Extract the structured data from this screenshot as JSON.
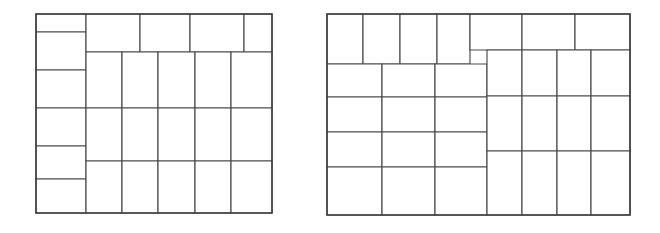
{
  "figure": {
    "title": "",
    "background_color": "#ffffff",
    "stroke_color": "#4a4a4a",
    "fill_color": "#ffffff",
    "width": 660,
    "height": 233,
    "caption": ""
  },
  "chart_data": {
    "type": "diagram",
    "subtype": "rectangle-packing-layout",
    "title": "",
    "xlabel": "",
    "ylabel": "",
    "grid": false,
    "legend": null,
    "panels": [
      {
        "name": "left-packing",
        "label": "",
        "container": {
          "x": 36,
          "y": 14,
          "width": 236,
          "height": 199
        },
        "rect_count": 27,
        "rects": [
          {
            "id": "L1",
            "x": 36,
            "y": 14,
            "width": 50,
            "height": 18
          },
          {
            "id": "L2",
            "x": 36,
            "y": 32,
            "width": 50,
            "height": 38
          },
          {
            "id": "L3",
            "x": 36,
            "y": 70,
            "width": 50,
            "height": 38
          },
          {
            "id": "L4",
            "x": 36,
            "y": 108,
            "width": 50,
            "height": 38
          },
          {
            "id": "L5",
            "x": 36,
            "y": 146,
            "width": 50,
            "height": 33
          },
          {
            "id": "L6",
            "x": 36,
            "y": 179,
            "width": 50,
            "height": 34
          },
          {
            "id": "L7",
            "x": 86,
            "y": 14,
            "width": 54,
            "height": 38
          },
          {
            "id": "L8",
            "x": 140,
            "y": 14,
            "width": 50,
            "height": 38
          },
          {
            "id": "L9",
            "x": 190,
            "y": 14,
            "width": 54,
            "height": 38
          },
          {
            "id": "L10",
            "x": 244,
            "y": 14,
            "width": 28,
            "height": 38
          },
          {
            "id": "L11",
            "x": 86,
            "y": 52,
            "width": 36,
            "height": 56
          },
          {
            "id": "L12",
            "x": 122,
            "y": 52,
            "width": 36,
            "height": 56
          },
          {
            "id": "L13",
            "x": 158,
            "y": 52,
            "width": 37,
            "height": 56
          },
          {
            "id": "L14",
            "x": 195,
            "y": 52,
            "width": 36,
            "height": 56
          },
          {
            "id": "L15",
            "x": 231,
            "y": 52,
            "width": 41,
            "height": 56
          },
          {
            "id": "L16",
            "x": 86,
            "y": 108,
            "width": 36,
            "height": 53
          },
          {
            "id": "L17",
            "x": 122,
            "y": 108,
            "width": 36,
            "height": 53
          },
          {
            "id": "L18",
            "x": 158,
            "y": 108,
            "width": 37,
            "height": 53
          },
          {
            "id": "L19",
            "x": 195,
            "y": 108,
            "width": 36,
            "height": 53
          },
          {
            "id": "L20",
            "x": 231,
            "y": 108,
            "width": 41,
            "height": 53
          },
          {
            "id": "L21",
            "x": 86,
            "y": 161,
            "width": 36,
            "height": 52
          },
          {
            "id": "L22",
            "x": 122,
            "y": 161,
            "width": 36,
            "height": 52
          },
          {
            "id": "L23",
            "x": 158,
            "y": 161,
            "width": 37,
            "height": 52
          },
          {
            "id": "L24",
            "x": 195,
            "y": 161,
            "width": 36,
            "height": 52
          },
          {
            "id": "L25",
            "x": 231,
            "y": 161,
            "width": 41,
            "height": 52
          }
        ]
      },
      {
        "name": "right-packing",
        "label": "",
        "container": {
          "x": 327,
          "y": 14,
          "width": 303,
          "height": 201
        },
        "rect_count": 29,
        "rects": [
          {
            "id": "R1",
            "x": 327,
            "y": 14,
            "width": 36,
            "height": 50
          },
          {
            "id": "R2",
            "x": 363,
            "y": 14,
            "width": 37,
            "height": 50
          },
          {
            "id": "R3",
            "x": 400,
            "y": 14,
            "width": 37,
            "height": 50
          },
          {
            "id": "R4",
            "x": 437,
            "y": 14,
            "width": 33,
            "height": 50
          },
          {
            "id": "R5",
            "x": 470,
            "y": 14,
            "width": 52,
            "height": 36
          },
          {
            "id": "R6",
            "x": 522,
            "y": 14,
            "width": 53,
            "height": 36
          },
          {
            "id": "R7",
            "x": 575,
            "y": 14,
            "width": 55,
            "height": 36
          },
          {
            "id": "R8",
            "x": 327,
            "y": 64,
            "width": 55,
            "height": 33
          },
          {
            "id": "R9",
            "x": 382,
            "y": 64,
            "width": 53,
            "height": 33
          },
          {
            "id": "R10",
            "x": 435,
            "y": 64,
            "width": 52,
            "height": 33
          },
          {
            "id": "R11",
            "x": 327,
            "y": 97,
            "width": 55,
            "height": 35
          },
          {
            "id": "R12",
            "x": 382,
            "y": 97,
            "width": 53,
            "height": 35
          },
          {
            "id": "R13",
            "x": 435,
            "y": 97,
            "width": 52,
            "height": 35
          },
          {
            "id": "R14",
            "x": 327,
            "y": 132,
            "width": 55,
            "height": 35
          },
          {
            "id": "R15",
            "x": 382,
            "y": 132,
            "width": 53,
            "height": 35
          },
          {
            "id": "R16",
            "x": 435,
            "y": 132,
            "width": 52,
            "height": 35
          },
          {
            "id": "R17",
            "x": 327,
            "y": 167,
            "width": 55,
            "height": 48
          },
          {
            "id": "R18",
            "x": 382,
            "y": 167,
            "width": 53,
            "height": 48
          },
          {
            "id": "R19",
            "x": 435,
            "y": 167,
            "width": 52,
            "height": 48
          },
          {
            "id": "R20",
            "x": 487,
            "y": 50,
            "width": 35,
            "height": 46
          },
          {
            "id": "R21",
            "x": 522,
            "y": 50,
            "width": 35,
            "height": 46
          },
          {
            "id": "R22",
            "x": 557,
            "y": 50,
            "width": 34,
            "height": 46
          },
          {
            "id": "R23",
            "x": 591,
            "y": 50,
            "width": 39,
            "height": 46
          },
          {
            "id": "R24",
            "x": 487,
            "y": 96,
            "width": 35,
            "height": 55
          },
          {
            "id": "R25",
            "x": 522,
            "y": 96,
            "width": 35,
            "height": 55
          },
          {
            "id": "R26",
            "x": 557,
            "y": 96,
            "width": 34,
            "height": 55
          },
          {
            "id": "R27",
            "x": 591,
            "y": 96,
            "width": 39,
            "height": 55
          },
          {
            "id": "R28",
            "x": 487,
            "y": 151,
            "width": 35,
            "height": 64
          },
          {
            "id": "R29",
            "x": 522,
            "y": 151,
            "width": 35,
            "height": 64
          },
          {
            "id": "R30",
            "x": 557,
            "y": 151,
            "width": 34,
            "height": 64
          },
          {
            "id": "R31",
            "x": 591,
            "y": 151,
            "width": 39,
            "height": 64
          }
        ]
      }
    ]
  }
}
